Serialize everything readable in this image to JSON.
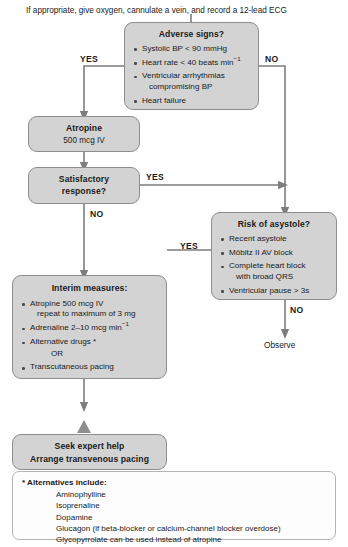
{
  "header": {
    "instruction": "If appropriate, give oxygen, cannulate a vein, and record a 12-lead ECG"
  },
  "colors": {
    "node_fill": "#d3d3d3",
    "node_border": "#8d8d8d",
    "connector": "#7d7d7d",
    "footnote_fill": "#fdfdfd",
    "text": "#1a1a1a"
  },
  "nodes": {
    "adverse_signs": {
      "title": "Adverse signs?",
      "bullets": [
        "Systolic BP < 90 mmHg",
        "Heart rate < 40 beats min",
        "Ventricular arrhythmias",
        "compromising BP",
        "Heart failure"
      ],
      "b1": "Systolic BP < 90 mmHg",
      "b2_pre": "Heart rate < 40 beats min",
      "b2_sup": "−1",
      "b3": "Ventricular arrhythmias",
      "b3_cont": "compromising BP",
      "b4": "Heart failure"
    },
    "atropine": {
      "title": "Atropine",
      "subtitle": "500 mcg IV"
    },
    "satisfactory": {
      "line1": "Satisfactory",
      "line2": "response?"
    },
    "risk_asystole": {
      "title": "Risk of asystole?",
      "b1": "Recent asystole",
      "b2": "Möbitz II AV block",
      "b3": "Complete heart block",
      "b3_cont": "with broad QRS",
      "b4": "Ventricular pause > 3s"
    },
    "interim": {
      "title": "Interim measures:",
      "b1": "Atropine 500 mcg IV",
      "b1_cont": "repeat to maximum of 3 mg",
      "b2_pre": "Adrenaline 2–10 mcg min",
      "b2_sup": "−1",
      "b3": "Alternative drugs *",
      "b3_or": "OR",
      "b4": "Transcutaneous pacing"
    },
    "seek_help": {
      "line1": "Seek expert help",
      "line2": "Arrange transvenous pacing"
    },
    "observe": {
      "label": "Observe"
    }
  },
  "labels": {
    "yes_adverse": "YES",
    "no_adverse": "NO",
    "yes_satisfactory": "YES",
    "no_satisfactory": "NO",
    "yes_asystole": "YES",
    "no_asystole": "NO"
  },
  "footnote": {
    "heading": "* Alternatives include:",
    "items": [
      "Aminophylline",
      "Isoprenaline",
      "Dopamine",
      "Glucagon (if beta-blocker or calcium-channel blocker overdose)",
      "Glycopyrrolate can be used instead of atropine"
    ]
  }
}
